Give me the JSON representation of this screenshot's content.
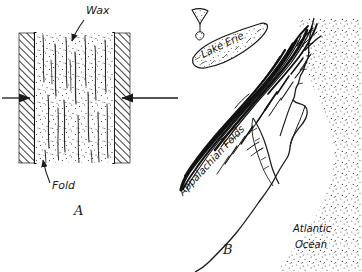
{
  "figure": {
    "kind": "two-panel pen-and-ink scientific diagram",
    "background_color": "#ffffff",
    "ink_color": "#1a1a1a"
  },
  "panel_a": {
    "letter": "A",
    "subject": "wax block compressed between vise jaws forming folds",
    "labels": {
      "wax": "Wax",
      "fold": "Fold"
    },
    "annotations": {
      "left_arrow": "compression-arrow-left",
      "right_arrow": "compression-arrow-right",
      "wax_leader": "leader-line-to-wax",
      "fold_leader": "leader-line-to-fold"
    },
    "textures": {
      "jaw": "diagonal-hatching",
      "wax": "stipple"
    }
  },
  "panel_b": {
    "letter": "B",
    "subject": "sketch map of Appalachian fold belt, Lake Erie and Atlantic coast",
    "labels": {
      "lake_erie": "Lake Erie",
      "appalachian_folds": "Appalachian Folds",
      "atlantic_ocean_line1": "Atlantic",
      "atlantic_ocean_line2": "Ocean"
    },
    "features": {
      "lake": "lake-erie-outline",
      "small_lake": "small-lake-outline",
      "folds": "appalachian-fold-belt",
      "coast": "atlantic-coastline",
      "ocean": "stippled-ocean"
    }
  }
}
